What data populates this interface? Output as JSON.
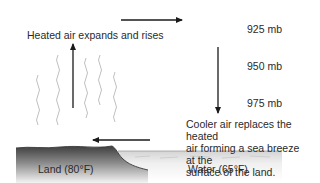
{
  "diagram": {
    "labels": {
      "heated_air": "Heated air expands and rises",
      "cooler_air": "Cooler air replaces the heated\nair forming a sea breeze at the\nsurface of the land.",
      "land": "Land (80°F)",
      "water": "Water (65°F)"
    },
    "pressure_levels": [
      {
        "label": "925 mb"
      },
      {
        "label": "950 mb"
      },
      {
        "label": "975 mb"
      }
    ],
    "arrows": [
      {
        "name": "upper-flow-arrow",
        "direction": "right"
      },
      {
        "name": "sinking-air-arrow",
        "direction": "down"
      },
      {
        "name": "sea-breeze-arrow",
        "direction": "left"
      },
      {
        "name": "rising-air-arrow",
        "direction": "up"
      }
    ],
    "colors": {
      "arrow": "#1a1a1a",
      "land_dark": "#4a4a4a",
      "land_light": "#e6e6e6",
      "water": "#f2f2f2",
      "heat_lines": "#b5b5b5"
    }
  }
}
